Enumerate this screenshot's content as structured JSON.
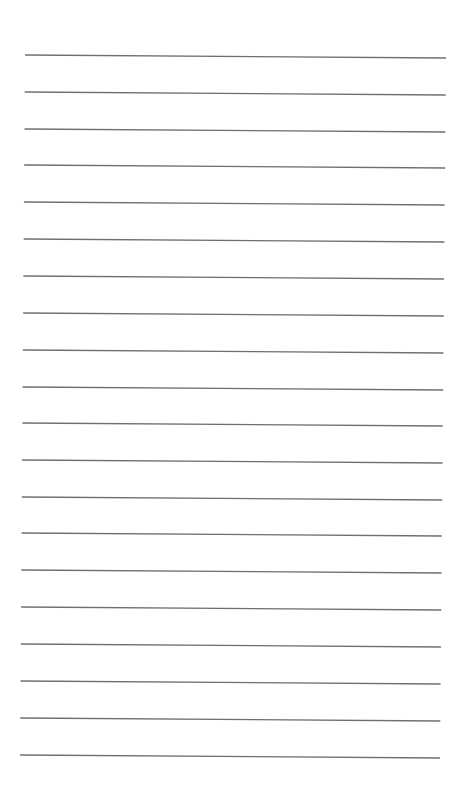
{
  "document": {
    "type": "lined-paper",
    "background_color": "#ffffff",
    "line_color": "#6f6f6f",
    "line_count": 20,
    "lines": [
      {
        "x1": 25.0,
        "y1": 55,
        "x2": 446.0,
        "y2": 58
      },
      {
        "x1": 24.7,
        "y1": 92,
        "x2": 445.7,
        "y2": 95
      },
      {
        "x1": 24.5,
        "y1": 129,
        "x2": 445.4,
        "y2": 132
      },
      {
        "x1": 24.2,
        "y1": 165,
        "x2": 445.1,
        "y2": 168
      },
      {
        "x1": 23.9,
        "y1": 202,
        "x2": 444.7,
        "y2": 205
      },
      {
        "x1": 23.7,
        "y1": 239,
        "x2": 444.4,
        "y2": 242
      },
      {
        "x1": 23.4,
        "y1": 276,
        "x2": 444.1,
        "y2": 279
      },
      {
        "x1": 23.2,
        "y1": 313,
        "x2": 443.8,
        "y2": 316
      },
      {
        "x1": 22.9,
        "y1": 350,
        "x2": 443.5,
        "y2": 353
      },
      {
        "x1": 22.6,
        "y1": 387,
        "x2": 443.2,
        "y2": 390
      },
      {
        "x1": 22.4,
        "y1": 423,
        "x2": 442.8,
        "y2": 426
      },
      {
        "x1": 22.1,
        "y1": 460,
        "x2": 442.5,
        "y2": 463
      },
      {
        "x1": 21.8,
        "y1": 497,
        "x2": 442.2,
        "y2": 500
      },
      {
        "x1": 21.6,
        "y1": 533,
        "x2": 441.9,
        "y2": 536
      },
      {
        "x1": 21.3,
        "y1": 570,
        "x2": 441.6,
        "y2": 573
      },
      {
        "x1": 21.1,
        "y1": 607,
        "x2": 441.3,
        "y2": 610
      },
      {
        "x1": 20.8,
        "y1": 644,
        "x2": 440.9,
        "y2": 647
      },
      {
        "x1": 20.5,
        "y1": 681,
        "x2": 440.6,
        "y2": 684
      },
      {
        "x1": 20.3,
        "y1": 718,
        "x2": 440.3,
        "y2": 721
      },
      {
        "x1": 20.0,
        "y1": 755,
        "x2": 440.0,
        "y2": 758
      }
    ]
  }
}
